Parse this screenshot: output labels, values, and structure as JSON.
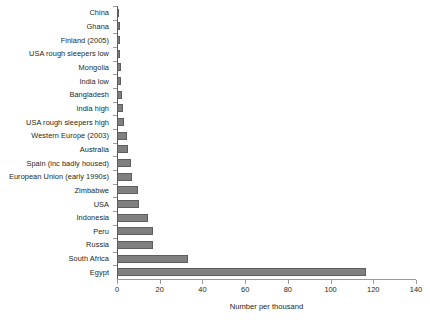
{
  "chart_data": {
    "type": "bar",
    "orientation": "horizontal",
    "title": "",
    "xlabel": "Number per thousand",
    "ylabel": "",
    "xlim": [
      0,
      140
    ],
    "xticks": [
      0,
      20,
      40,
      60,
      80,
      100,
      120,
      140
    ],
    "grid": false,
    "legend": false,
    "bar_color": "#808080",
    "bar_edge_color": "#5e5e5e",
    "axis_color": "#9a9a9a",
    "text_color": "#231f20",
    "categories": [
      "China",
      "Ghana",
      "Finland (2005)",
      "USA rough sleepers low",
      "Mongolia",
      "India low",
      "Bangladesh",
      "India high",
      "USA rough sleepers high",
      "Western Europe (2003)",
      "Australia",
      "Spain (inc badly housed)",
      "European Union (early 1990s)",
      "Zimbabwe",
      "USA",
      "Indonesia",
      "Peru",
      "Russia",
      "South Africa",
      "Egypt"
    ],
    "values": [
      1,
      1.2,
      1.5,
      1.6,
      1.8,
      2,
      2.5,
      3,
      3.5,
      4.5,
      5,
      6.5,
      7,
      10,
      10.5,
      14.5,
      17,
      17,
      33.5,
      117
    ]
  }
}
